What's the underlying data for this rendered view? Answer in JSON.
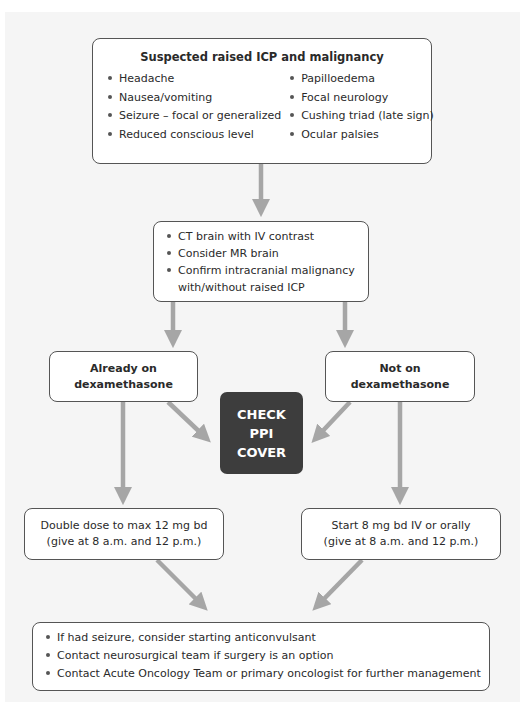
{
  "diagram": {
    "type": "flowchart",
    "colors": {
      "background_panel": "#f5f5f5",
      "box_fill": "#ffffff",
      "box_border": "#555555",
      "arrow": "#a6a6a6",
      "highlight_box": "#3d3d3d",
      "highlight_text": "#ffffff"
    },
    "top_box": {
      "title": "Suspected raised ICP and malignancy",
      "left_items": [
        "Headache",
        "Nausea/vomiting",
        "Seizure – focal or generalized",
        "Reduced conscious level"
      ],
      "right_items": [
        "Papilloedema",
        "Focal neurology",
        "Cushing triad (late sign)",
        "Ocular palsies"
      ]
    },
    "middle_box": {
      "items": [
        "CT brain with IV contrast",
        "Consider MR brain",
        "Confirm intracranial malignancy with/without raised ICP"
      ]
    },
    "branches": {
      "left": {
        "line1": "Already on",
        "line2": "dexamethasone"
      },
      "right": {
        "line1": "Not on",
        "line2": "dexamethasone"
      }
    },
    "check_ppi": {
      "line1": "CHECK",
      "line2": "PPI",
      "line3": "COVER"
    },
    "doses": {
      "left": {
        "line1": "Double dose to max 12 mg bd",
        "line2": "(give at 8 a.m. and 12 p.m.)"
      },
      "right": {
        "line1": "Start 8 mg bd IV or orally",
        "line2": "(give at 8 a.m. and 12 p.m.)"
      }
    },
    "bottom_box": {
      "items": [
        "If had seizure, consider starting anticonvulsant",
        "Contact neurosurgical team if surgery is an option",
        "Contact Acute Oncology Team or primary oncologist for further management"
      ]
    }
  }
}
